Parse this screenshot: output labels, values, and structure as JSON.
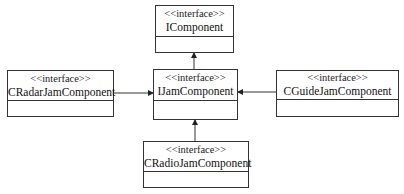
{
  "diagram": {
    "type": "uml-class-diagram",
    "nodes": [
      {
        "id": "icomponent",
        "stereotype": "<<interface>>",
        "name": "IComponent"
      },
      {
        "id": "ijamcomponent",
        "stereotype": "<<interface>>",
        "name": "IJamComponent"
      },
      {
        "id": "cradarjam",
        "stereotype": "<<interface>>",
        "name": "CRadarJamComponent"
      },
      {
        "id": "cguidejam",
        "stereotype": "<<interface>>",
        "name": "CGuideJamComponent"
      },
      {
        "id": "cradiojam",
        "stereotype": "<<interface>>",
        "name": "CRadioJamComponent"
      }
    ],
    "edges": [
      {
        "from": "ijamcomponent",
        "to": "icomponent",
        "kind": "arrow"
      },
      {
        "from": "cradarjam",
        "to": "ijamcomponent",
        "kind": "arrow"
      },
      {
        "from": "cguidejam",
        "to": "ijamcomponent",
        "kind": "arrow"
      },
      {
        "from": "cradiojam",
        "to": "ijamcomponent",
        "kind": "arrow"
      }
    ],
    "colors": {
      "line": "#333333",
      "background": "#ffffff",
      "text": "#111111"
    }
  }
}
